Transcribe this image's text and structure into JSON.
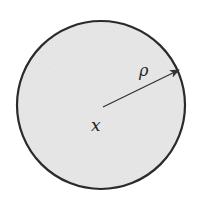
{
  "diagram": {
    "type": "ball",
    "center_label": "x",
    "radius_label": "ρ",
    "colors": {
      "fill": "#e9e9e9",
      "stroke": "#2a2a2a",
      "arrow": "#333333",
      "background": "#ffffff"
    }
  }
}
